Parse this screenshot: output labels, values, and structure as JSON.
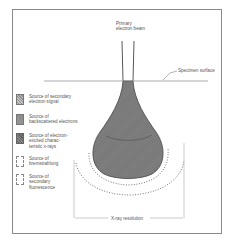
{
  "diagram": {
    "beam_label": "Primary\nelectron beam",
    "surface_label": "Specimen surface",
    "resolution_label": "X-ray resolution",
    "legend": [
      {
        "label": "Source of secondary\nelectron signal",
        "style": "hatched-light"
      },
      {
        "label": "Source of\nbackscattered electrons",
        "style": "solid-gray"
      },
      {
        "label": "Source of electron-\nexcited charac-\nteristic x-rays",
        "style": "hatched-dark"
      },
      {
        "label": "Source of\nbremstrahlung",
        "style": "dashed"
      },
      {
        "label": "Source of\nsecondary\nfluorescence",
        "style": "dashed"
      }
    ],
    "colors": {
      "frame": "#8a8a8a",
      "fill": "#7a7a7a",
      "hatch": "#5a5a5a",
      "line": "#444444"
    }
  }
}
